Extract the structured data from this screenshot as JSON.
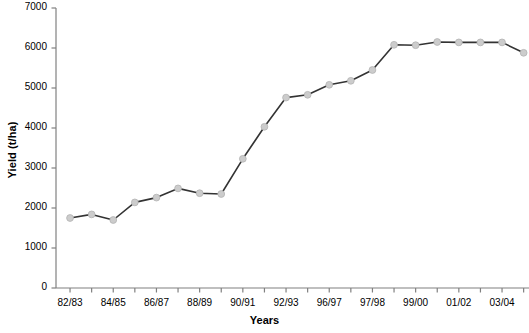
{
  "chart_data": {
    "type": "line",
    "title": "",
    "xlabel": "Years",
    "ylabel": "Yield (t/ha)",
    "ylim": [
      0,
      7000
    ],
    "ytick_labels": [
      "0",
      "1000",
      "2000",
      "3000",
      "4000",
      "5000",
      "6000",
      "7000"
    ],
    "ytick_values": [
      0,
      1000,
      2000,
      3000,
      4000,
      5000,
      6000,
      7000
    ],
    "grid": false,
    "legend": null,
    "marker": "circle",
    "marker_color": "#cccccc",
    "marker_edge_color": "#b3b3b3",
    "line_color": "#333333",
    "axis_color": "#808080",
    "categories": [
      "82/83",
      "83/84",
      "84/85",
      "85/86",
      "86/87",
      "87/88",
      "88/89",
      "89/90",
      "90/91",
      "91/92",
      "92/93",
      "93/94",
      "96/97",
      "97/98",
      "98/99",
      "99/00",
      "00/01",
      "01/02",
      "02/03",
      "03/04",
      "04/05",
      "05/06"
    ],
    "xtick_labels_shown": [
      "82/83",
      "84/85",
      "86/87",
      "88/89",
      "90/91",
      "92/93",
      "96/97",
      "97/98",
      "99/00",
      "01/02",
      "03/04"
    ],
    "values": [
      1750,
      1840,
      1700,
      2140,
      2260,
      2490,
      2370,
      2350,
      3230,
      4030,
      4760,
      4830,
      5080,
      5180,
      5450,
      6080,
      6070,
      6150,
      6140,
      6140,
      6140,
      5880
    ]
  }
}
